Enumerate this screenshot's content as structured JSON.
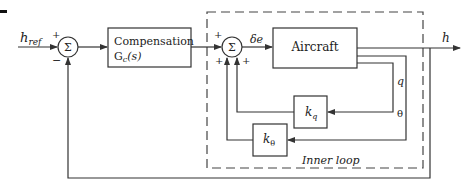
{
  "diagram": {
    "type": "block-diagram",
    "title": "",
    "colors": {
      "line": "#333333",
      "background": "#ffffff"
    },
    "signals": {
      "input": "h",
      "input_sub": "ref",
      "output": "h",
      "control": "δe",
      "pitch_rate": "q",
      "pitch": "θ"
    },
    "summing_junctions": [
      {
        "id": "sum1",
        "symbol": "Σ",
        "signs": {
          "top": "+",
          "bottom": "−"
        }
      },
      {
        "id": "sum2",
        "symbol": "Σ",
        "signs": {
          "left": "+",
          "bottom_left": "+",
          "bottom_right": "+"
        }
      }
    ],
    "blocks": {
      "compensation": {
        "line1": "Compensation",
        "line2_main": "G",
        "line2_sub": "c",
        "line2_tail": "(s)"
      },
      "aircraft": {
        "label": "Aircraft"
      },
      "kq": {
        "main": "k",
        "sub": "q"
      },
      "ktheta": {
        "main": "k",
        "sub": "θ"
      }
    },
    "inner_loop_label": "Inner loop"
  }
}
